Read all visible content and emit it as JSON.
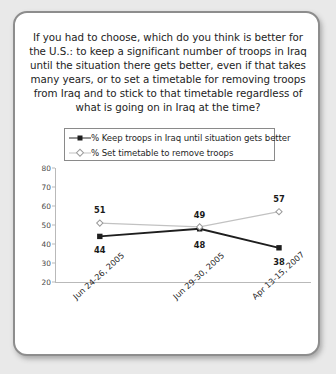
{
  "card": {
    "question": "If you had to choose, which do you think is better for the U.S.: to keep a significant number of troops in Iraq until the situation there gets better, even if that takes many years, or to set a timetable for removing troops from Iraq and to stick to that timetable regardless of what is going on in Iraq at the time?"
  },
  "chart_data": {
    "type": "line",
    "title": "",
    "xlabel": "",
    "ylabel": "",
    "ylim": [
      20,
      80
    ],
    "yticks": [
      20,
      30,
      40,
      50,
      60,
      70,
      80
    ],
    "grid": false,
    "legend_position": "top",
    "categories": [
      "Jun 24-26, 2005",
      "Jun 29-30, 2005",
      "Apr 13-15, 2007"
    ],
    "series": [
      {
        "name": "% Keep troops in Iraq until situation gets better",
        "values": [
          44,
          48,
          38
        ],
        "color": "#1e1e1e",
        "marker": "square-filled"
      },
      {
        "name": "% Set timetable to remove troops",
        "values": [
          51,
          49,
          57
        ],
        "color": "#c2c2c2",
        "marker": "diamond-open"
      }
    ]
  }
}
